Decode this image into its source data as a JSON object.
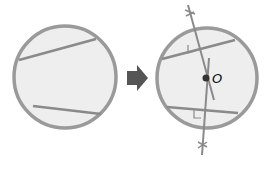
{
  "diagram": {
    "colors": {
      "circle_stroke": "#9a9a9a",
      "circle_fill": "#eeeeee",
      "chord": "#8a8a8a",
      "bisector": "#8a8a8a",
      "arrow": "#555555",
      "center_point": "#333333",
      "label": "#111111"
    },
    "left_figure": {
      "circle": {
        "cx": 65,
        "cy": 77,
        "r": 51
      },
      "chords": [
        {
          "x1": 19,
          "y1": 60,
          "x2": 96,
          "y2": 39
        },
        {
          "x1": 33,
          "y1": 106,
          "x2": 101,
          "y2": 114
        }
      ]
    },
    "arrow": {
      "direction": "right",
      "icon": "right-arrow-icon"
    },
    "right_figure": {
      "circle": {
        "cx": 207,
        "cy": 78,
        "r": 50
      },
      "chords": [
        {
          "x1": 162,
          "y1": 59,
          "x2": 235,
          "y2": 40
        },
        {
          "x1": 167,
          "y1": 107,
          "x2": 238,
          "y2": 113
        }
      ],
      "bisectors": [
        {
          "x1": 188,
          "y1": 5,
          "x2": 214,
          "y2": 100
        },
        {
          "x1": 202,
          "y1": 155,
          "x2": 209,
          "y2": 58
        }
      ],
      "center": {
        "x": 206,
        "y": 78
      },
      "center_label": "O"
    }
  }
}
